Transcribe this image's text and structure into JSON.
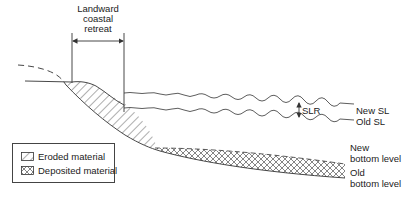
{
  "diagram": {
    "title_lines": [
      "Landward",
      "coastal",
      "retreat"
    ],
    "labels": {
      "slr": "SLR",
      "new_sl": "New SL",
      "old_sl": "Old SL",
      "new_bottom_line1": "New",
      "new_bottom_line2": "bottom level",
      "old_bottom_line1": "Old",
      "old_bottom_line2": "bottom level"
    },
    "legend": {
      "items": [
        {
          "label": "Eroded material",
          "pattern": "diagonal-hatch"
        },
        {
          "label": "Deposited material",
          "pattern": "cross-hatch"
        }
      ]
    },
    "colors": {
      "line": "#333333",
      "background": "#ffffff"
    }
  }
}
